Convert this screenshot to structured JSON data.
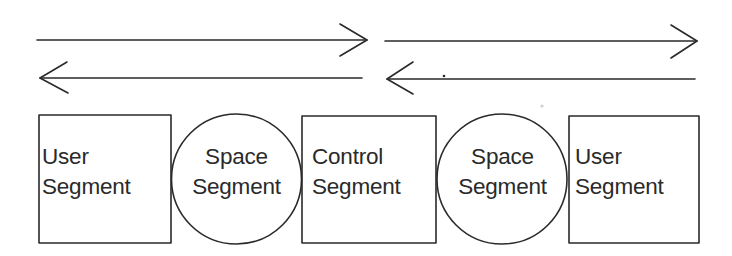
{
  "diagram": {
    "type": "segment-flow",
    "stroke_color": "#2a2a2a",
    "arrows": [
      {
        "id": "top-left",
        "direction": "right"
      },
      {
        "id": "bottom-left",
        "direction": "left"
      },
      {
        "id": "top-right",
        "direction": "right"
      },
      {
        "id": "bottom-right",
        "direction": "left"
      }
    ],
    "nodes": [
      {
        "shape": "box",
        "line1": "User",
        "line2": "Segment"
      },
      {
        "shape": "circle",
        "line1": "Space",
        "line2": "Segment"
      },
      {
        "shape": "box",
        "line1": "Control",
        "line2": "Segment"
      },
      {
        "shape": "circle",
        "line1": "Space",
        "line2": "Segment"
      },
      {
        "shape": "box",
        "line1": "User",
        "line2": "Segment"
      }
    ]
  }
}
